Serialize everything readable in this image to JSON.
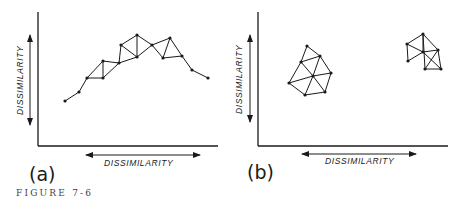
{
  "figure": {
    "caption": "FIGURE 7-6",
    "ink_color": "#1a1a1a",
    "background": "#ffffff"
  },
  "panels": [
    {
      "id": "a",
      "label": "(a)",
      "x_axis_label": "DISSIMILARITY",
      "y_axis_label": "DISSIMILARITY",
      "description": "chained graph of points forming a continuous arch"
    },
    {
      "id": "b",
      "label": "(b)",
      "x_axis_label": "DISSIMILARITY",
      "y_axis_label": "DISSIMILARITY",
      "description": "two separate triangulated clusters"
    }
  ],
  "graphs": {
    "a": {
      "nodes": [
        [
          65,
          101
        ],
        [
          79,
          92
        ],
        [
          87,
          78
        ],
        [
          103,
          78
        ],
        [
          103,
          61
        ],
        [
          119,
          63
        ],
        [
          121,
          45
        ],
        [
          137,
          57
        ],
        [
          137,
          35
        ],
        [
          152,
          45
        ],
        [
          163,
          58
        ],
        [
          170,
          38
        ],
        [
          182,
          56
        ],
        [
          192,
          70
        ],
        [
          208,
          78
        ]
      ],
      "edges": [
        [
          0,
          1
        ],
        [
          1,
          2
        ],
        [
          2,
          3
        ],
        [
          2,
          4
        ],
        [
          3,
          4
        ],
        [
          4,
          5
        ],
        [
          3,
          5
        ],
        [
          5,
          7
        ],
        [
          6,
          7
        ],
        [
          6,
          8
        ],
        [
          7,
          8
        ],
        [
          6,
          5
        ],
        [
          8,
          9
        ],
        [
          7,
          9
        ],
        [
          9,
          10
        ],
        [
          9,
          11
        ],
        [
          10,
          11
        ],
        [
          10,
          12
        ],
        [
          11,
          12
        ],
        [
          12,
          13
        ],
        [
          13,
          14
        ]
      ]
    },
    "b1": {
      "nodes": [
        [
          307,
          46
        ],
        [
          320,
          56
        ],
        [
          301,
          62
        ],
        [
          331,
          73
        ],
        [
          313,
          76
        ],
        [
          289,
          83
        ],
        [
          305,
          95
        ],
        [
          325,
          92
        ]
      ],
      "edges": [
        [
          0,
          1
        ],
        [
          0,
          2
        ],
        [
          1,
          2
        ],
        [
          1,
          3
        ],
        [
          1,
          4
        ],
        [
          2,
          4
        ],
        [
          2,
          5
        ],
        [
          3,
          4
        ],
        [
          3,
          7
        ],
        [
          4,
          5
        ],
        [
          4,
          6
        ],
        [
          4,
          7
        ],
        [
          5,
          6
        ],
        [
          6,
          7
        ]
      ]
    },
    "b2": {
      "nodes": [
        [
          407,
          44
        ],
        [
          423,
          34
        ],
        [
          438,
          50
        ],
        [
          423,
          52
        ],
        [
          408,
          61
        ],
        [
          425,
          69
        ],
        [
          441,
          69
        ]
      ],
      "edges": [
        [
          0,
          1
        ],
        [
          0,
          3
        ],
        [
          0,
          4
        ],
        [
          1,
          2
        ],
        [
          1,
          3
        ],
        [
          1,
          5
        ],
        [
          2,
          3
        ],
        [
          2,
          5
        ],
        [
          2,
          6
        ],
        [
          3,
          4
        ],
        [
          3,
          6
        ],
        [
          5,
          6
        ]
      ]
    }
  }
}
